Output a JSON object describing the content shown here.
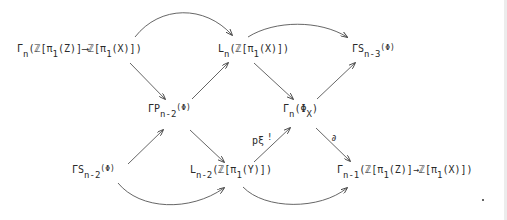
{
  "diagram": {
    "type": "commutative-diagram",
    "nodes": {
      "gamma_n_map": {
        "pre": "Γ",
        "sub": "n",
        "post": "(ℤ[π",
        "sub2": "1",
        "post2": "(Z)]⟶ℤ[π",
        "sub3": "1",
        "post3": "(X)])"
      },
      "L_n": {
        "pre": "L",
        "sub": "n",
        "post": "(ℤ[π",
        "sub2": "1",
        "post2": "(X)])"
      },
      "gamma_S_n3": {
        "pre": "ΓS",
        "sub": "n-3",
        "post": "(Φ)"
      },
      "gamma_P_n2": {
        "pre": "ΓP",
        "sub": "n-2",
        "post": "(Φ)"
      },
      "gamma_n_phiX": {
        "pre": "Γ",
        "sub": "n",
        "post": "(Φ",
        "sub2": "X",
        "post2": ")"
      },
      "gamma_S_n2": {
        "pre": "ΓS",
        "sub": "n-2",
        "post": "(Φ)"
      },
      "L_n2": {
        "pre": "L",
        "sub": "n-2",
        "post": "(ℤ[π",
        "sub2": "1",
        "post2": "(Y)])"
      },
      "gamma_n1_map": {
        "pre": "Γ",
        "sub": "n-1",
        "post": "(ℤ[π",
        "sub2": "1",
        "post2": "(Z)]→ℤ[π",
        "sub3": "1",
        "post3": "(X)])"
      }
    },
    "labels": {
      "p_xi": "pξ",
      "p_xi_sup": "!",
      "boundary": "∂"
    },
    "edges": [
      {
        "from": "gamma_n_map",
        "to": "L_n",
        "style": "curved"
      },
      {
        "from": "gamma_n_map",
        "to": "gamma_P_n2",
        "style": "straight"
      },
      {
        "from": "gamma_P_n2",
        "to": "L_n",
        "style": "straight"
      },
      {
        "from": "L_n",
        "to": "gamma_S_n3",
        "style": "curved"
      },
      {
        "from": "L_n",
        "to": "gamma_n_phiX",
        "style": "straight"
      },
      {
        "from": "gamma_n_phiX",
        "to": "gamma_S_n3",
        "style": "straight"
      },
      {
        "from": "gamma_S_n2",
        "to": "gamma_P_n2",
        "style": "straight"
      },
      {
        "from": "gamma_P_n2",
        "to": "L_n2",
        "style": "straight"
      },
      {
        "from": "L_n2",
        "to": "gamma_n_phiX",
        "style": "straight",
        "label": "pξ!"
      },
      {
        "from": "gamma_n_phiX",
        "to": "gamma_n1_map",
        "style": "straight",
        "label": "∂"
      },
      {
        "from": "gamma_S_n2",
        "to": "L_n2",
        "style": "curved"
      },
      {
        "from": "L_n2",
        "to": "gamma_n1_map",
        "style": "curved"
      }
    ],
    "stroke_color": "#444444"
  }
}
